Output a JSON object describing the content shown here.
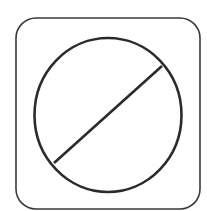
{
  "icon": {
    "name": "prohibited-icon",
    "stroke_color": "#333333",
    "background": "#ffffff"
  }
}
